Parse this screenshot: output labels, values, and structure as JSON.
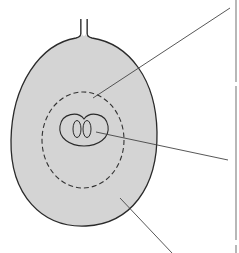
{
  "diagram": {
    "type": "seed-cross-section",
    "colors": {
      "fill": "#d4d4d4",
      "stroke": "#2a2a2a",
      "leader": "#444444",
      "border": "#888888",
      "background": "#ffffff"
    },
    "parts": [
      {
        "id": "stalk",
        "label": ""
      },
      {
        "id": "outer-coat",
        "label": ""
      },
      {
        "id": "dashed-boundary",
        "label": ""
      },
      {
        "id": "inner-kernel",
        "label": ""
      },
      {
        "id": "embryo",
        "label": ""
      }
    ],
    "leader_lines": [
      {
        "from": [
          93,
          98
        ],
        "to": [
          230,
          8
        ],
        "label": ""
      },
      {
        "from": [
          96,
          132
        ],
        "to": [
          228,
          160
        ],
        "label": ""
      },
      {
        "from": [
          120,
          198
        ],
        "to": [
          172,
          253
        ],
        "label": ""
      }
    ]
  }
}
